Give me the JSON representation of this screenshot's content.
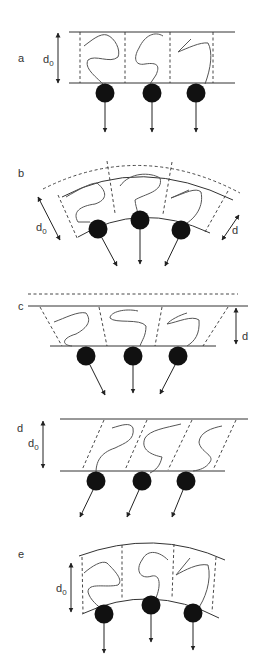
{
  "figure": {
    "type": "schematic",
    "panels": [
      {
        "id": "a",
        "label": "a",
        "thickness_labels": [
          "d0"
        ],
        "state": "flat, undeformed"
      },
      {
        "id": "b",
        "label": "b",
        "thickness_labels": [
          "d0",
          "d"
        ],
        "state": "bent (curved outward)"
      },
      {
        "id": "c",
        "label": "c",
        "thickness_labels": [
          "d"
        ],
        "state": "compressed, splayed"
      },
      {
        "id": "d",
        "label": "d",
        "thickness_labels": [
          "d",
          "d0"
        ],
        "state": "sheared"
      },
      {
        "id": "e",
        "label": "e",
        "thickness_labels": [
          "d0"
        ],
        "state": "curved, constant thickness"
      }
    ],
    "symbols": {
      "d0": {
        "main": "d",
        "sub": "0"
      },
      "d": {
        "main": "d"
      }
    },
    "colors": {
      "line": "#333333",
      "ball": "#111111",
      "background": "#ffffff"
    }
  }
}
